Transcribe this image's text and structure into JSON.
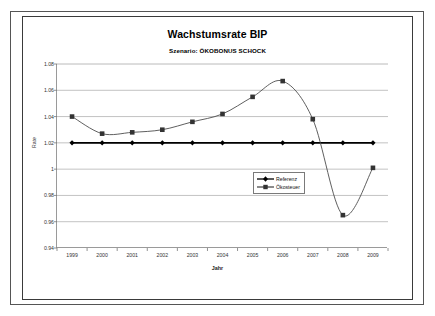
{
  "chart_data": {
    "type": "line",
    "title": "Wachstumsrate BIP",
    "subtitle": "Szenario: ÖKOBONUS SCHOCK",
    "xlabel": "Jahr",
    "ylabel": "Rate",
    "grid": "horizontal",
    "legend_position": "inside-lower-center-right",
    "categories": [
      "1999",
      "2000",
      "2001",
      "2002",
      "2003",
      "2004",
      "2005",
      "2006",
      "2007",
      "2008",
      "2009"
    ],
    "ylim": [
      0.94,
      1.08
    ],
    "ytick_step": 0.02,
    "ytick_labels": [
      "1.08",
      "1.06",
      "1.04",
      "1.02",
      "1",
      "0.98",
      "0.96",
      "0.94"
    ],
    "series": [
      {
        "name": "Referenz",
        "marker": "diamond",
        "color": "#000000",
        "values": [
          1.02,
          1.02,
          1.02,
          1.02,
          1.02,
          1.02,
          1.02,
          1.02,
          1.02,
          1.02,
          1.02
        ]
      },
      {
        "name": "Ökosteuer",
        "marker": "square",
        "color": "#4d4d4d",
        "values": [
          1.04,
          1.027,
          1.028,
          1.03,
          1.036,
          1.042,
          1.055,
          1.067,
          1.038,
          0.965,
          1.001
        ]
      }
    ]
  },
  "legend": {
    "items": [
      {
        "label": "Referenz"
      },
      {
        "label": "Ökosteuer"
      }
    ]
  }
}
